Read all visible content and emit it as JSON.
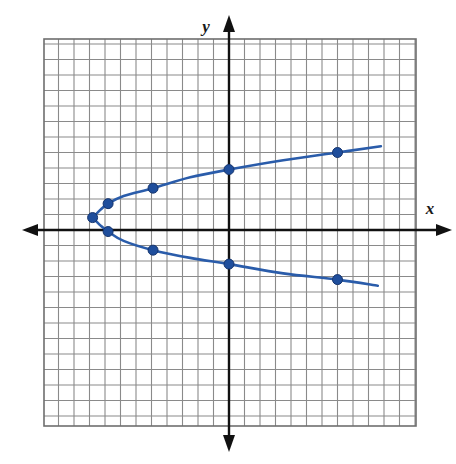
{
  "figure": {
    "axis_labels": {
      "x": "x",
      "y": "y"
    },
    "colors": {
      "curve": "#2a5caa",
      "point": "#1f4e9c",
      "axis": "#111111",
      "grid": "#8a8a8a",
      "grid_border": "#6e6e6e",
      "background": "#ffffff"
    }
  },
  "chart_data": {
    "type": "scatter",
    "title": "",
    "xlabel": "x",
    "ylabel": "y",
    "xlim": [
      -12,
      12
    ],
    "ylim": [
      -12.5,
      12
    ],
    "grid": true,
    "grid_step": 1,
    "tick_labels_shown": false,
    "legend": null,
    "series": [
      {
        "name": "parabola",
        "orientation": "opens-right",
        "vertex": [
          -8.8,
          0.8
        ],
        "points": [
          {
            "x": -8.8,
            "y": 0.8
          },
          {
            "x": -7.8,
            "y": 1.7
          },
          {
            "x": -7.8,
            "y": -0.1
          },
          {
            "x": -4.9,
            "y": 2.7
          },
          {
            "x": -4.9,
            "y": -1.3
          },
          {
            "x": 0.0,
            "y": 3.9
          },
          {
            "x": 0.0,
            "y": -2.2
          },
          {
            "x": 7.0,
            "y": 5.0
          },
          {
            "x": 7.0,
            "y": -3.2
          }
        ],
        "curve_upper": [
          [
            -8.8,
            0.8
          ],
          [
            -8.3,
            1.3
          ],
          [
            -7.8,
            1.7
          ],
          [
            -6.8,
            2.2
          ],
          [
            -4.9,
            2.7
          ],
          [
            -2.5,
            3.4
          ],
          [
            0.0,
            3.9
          ],
          [
            3.5,
            4.5
          ],
          [
            7.0,
            5.0
          ],
          [
            9.8,
            5.4
          ]
        ],
        "curve_lower": [
          [
            -8.8,
            0.8
          ],
          [
            -8.3,
            0.3
          ],
          [
            -7.8,
            -0.1
          ],
          [
            -6.8,
            -0.7
          ],
          [
            -4.9,
            -1.3
          ],
          [
            -2.5,
            -1.8
          ],
          [
            0.0,
            -2.2
          ],
          [
            3.5,
            -2.8
          ],
          [
            7.0,
            -3.2
          ],
          [
            9.6,
            -3.6
          ]
        ]
      }
    ]
  }
}
